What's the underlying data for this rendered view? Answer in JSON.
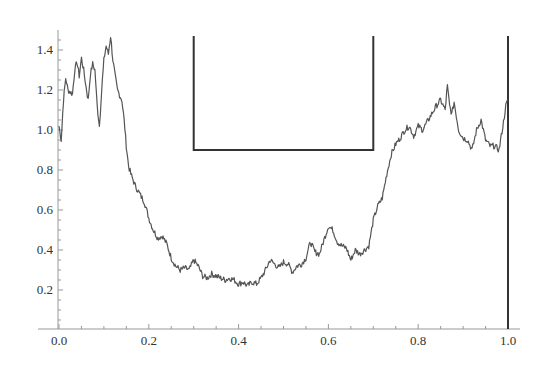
{
  "chart_data": {
    "type": "line",
    "title": "",
    "xlabel": "",
    "ylabel": "",
    "xlim": [
      0.0,
      1.0
    ],
    "ylim": [
      0.0,
      1.5
    ],
    "grid": false,
    "legend": null,
    "x_ticks": [
      "0.0",
      "0.2",
      "0.4",
      "0.6",
      "0.8",
      "1.0"
    ],
    "y_ticks": [
      "0.2",
      "0.4",
      "0.6",
      "0.8",
      "1.0",
      "1.2",
      "1.4"
    ],
    "series": [
      {
        "name": "path",
        "x": [
          0.0,
          0.005,
          0.01,
          0.015,
          0.02,
          0.03,
          0.035,
          0.04,
          0.045,
          0.05,
          0.055,
          0.06,
          0.065,
          0.07,
          0.075,
          0.08,
          0.085,
          0.09,
          0.095,
          0.1,
          0.105,
          0.11,
          0.115,
          0.12,
          0.125,
          0.13,
          0.14,
          0.145,
          0.15,
          0.155,
          0.16,
          0.17,
          0.18,
          0.19,
          0.2,
          0.21,
          0.22,
          0.23,
          0.24,
          0.25,
          0.26,
          0.27,
          0.28,
          0.29,
          0.3,
          0.31,
          0.32,
          0.33,
          0.34,
          0.35,
          0.36,
          0.37,
          0.38,
          0.39,
          0.4,
          0.41,
          0.42,
          0.43,
          0.44,
          0.45,
          0.46,
          0.47,
          0.48,
          0.49,
          0.5,
          0.51,
          0.52,
          0.53,
          0.54,
          0.55,
          0.56,
          0.57,
          0.58,
          0.59,
          0.6,
          0.61,
          0.62,
          0.63,
          0.64,
          0.65,
          0.66,
          0.67,
          0.68,
          0.69,
          0.7,
          0.71,
          0.72,
          0.73,
          0.74,
          0.75,
          0.76,
          0.77,
          0.78,
          0.79,
          0.8,
          0.81,
          0.82,
          0.83,
          0.84,
          0.85,
          0.86,
          0.865,
          0.87,
          0.875,
          0.88,
          0.89,
          0.9,
          0.91,
          0.92,
          0.93,
          0.94,
          0.95,
          0.96,
          0.97,
          0.98,
          0.99,
          0.995,
          1.0
        ],
        "y": [
          1.02,
          0.95,
          1.15,
          1.26,
          1.2,
          1.18,
          1.3,
          1.34,
          1.27,
          1.36,
          1.3,
          1.22,
          1.15,
          1.28,
          1.33,
          1.3,
          1.12,
          1.02,
          1.2,
          1.35,
          1.42,
          1.38,
          1.47,
          1.35,
          1.27,
          1.2,
          1.15,
          1.05,
          0.92,
          0.82,
          0.78,
          0.72,
          0.68,
          0.64,
          0.56,
          0.5,
          0.46,
          0.47,
          0.43,
          0.36,
          0.32,
          0.3,
          0.31,
          0.3,
          0.35,
          0.32,
          0.27,
          0.26,
          0.28,
          0.27,
          0.26,
          0.25,
          0.26,
          0.25,
          0.23,
          0.24,
          0.22,
          0.24,
          0.23,
          0.26,
          0.3,
          0.35,
          0.33,
          0.31,
          0.34,
          0.33,
          0.29,
          0.32,
          0.33,
          0.36,
          0.44,
          0.39,
          0.38,
          0.45,
          0.52,
          0.5,
          0.44,
          0.42,
          0.41,
          0.35,
          0.4,
          0.38,
          0.4,
          0.42,
          0.55,
          0.62,
          0.66,
          0.78,
          0.88,
          0.93,
          0.96,
          1.0,
          1.02,
          0.97,
          1.02,
          1.0,
          1.04,
          1.08,
          1.12,
          1.15,
          1.1,
          1.22,
          1.12,
          1.08,
          1.14,
          1.0,
          0.96,
          0.95,
          0.9,
          1.0,
          1.05,
          0.95,
          0.92,
          0.92,
          0.9,
          1.04,
          1.12,
          1.15
        ]
      }
    ],
    "overlays": [
      {
        "name": "cup-bracket",
        "type": "polyline",
        "x": [
          0.3,
          0.3,
          0.7,
          0.7
        ],
        "y": [
          1.47,
          0.9,
          0.9,
          1.47
        ]
      },
      {
        "name": "vertical-line-at-1",
        "type": "vline",
        "x": 1.0,
        "y": [
          0.0,
          1.47
        ]
      }
    ]
  }
}
